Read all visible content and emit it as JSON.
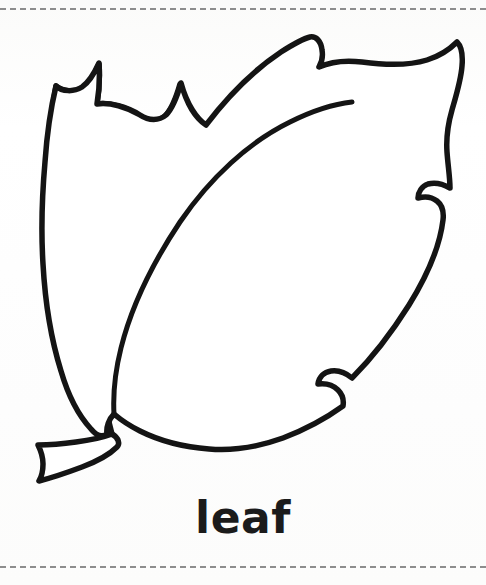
{
  "page": {
    "background_color": "#fdfdfc",
    "width": 486,
    "height": 585,
    "type": "coloring-page-worksheet"
  },
  "cut_lines": {
    "style": "dashed",
    "color": "#8d8d8d",
    "top_y": 8,
    "bottom_y": 566
  },
  "artwork": {
    "name": "leaf-outline",
    "description": "Black outline drawing of a serrated leaf with central midrib vein and a short stem at the lower left",
    "stroke_color": "#141414",
    "fill_color": "#ffffff",
    "stroke_width": 5
  },
  "caption": {
    "text": "leaf",
    "color": "#1b1b1b",
    "font_weight": "bold",
    "font_size_px": 44
  }
}
